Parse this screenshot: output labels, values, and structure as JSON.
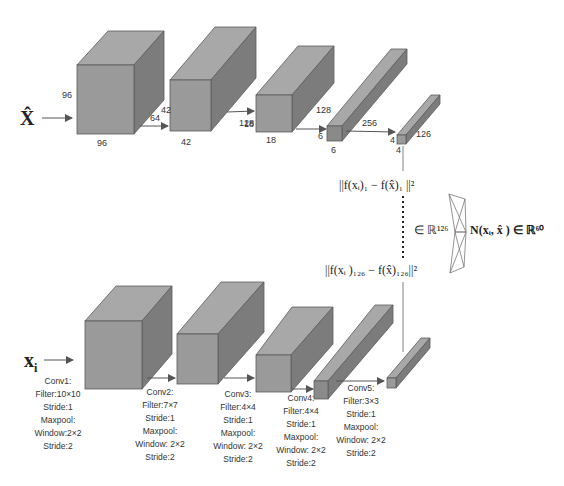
{
  "colors": {
    "front": "#9a9a9a",
    "top": "#a8a8a8",
    "side": "#7c7c7c",
    "edge": "#5a5a5a",
    "line": "#555555",
    "text": "#333333"
  },
  "top_branch": {
    "input_label": "X̂",
    "blocks": [
      {
        "id": "b1",
        "dims": {
          "height": "96",
          "width": "96",
          "depth": "64"
        }
      },
      {
        "id": "b2",
        "dims": {
          "height": "42",
          "width": "42",
          "depth": "128"
        }
      },
      {
        "id": "b3",
        "dims": {
          "height": "18",
          "width": "18",
          "depth": "128"
        }
      },
      {
        "id": "b4",
        "dims": {
          "height": "6",
          "width": "6",
          "depth": "256"
        }
      },
      {
        "id": "b5",
        "dims": {
          "height": "4",
          "width": "4",
          "depth": "126"
        }
      }
    ]
  },
  "bottom_branch": {
    "input_label": "x",
    "input_sub": "i",
    "layers": [
      {
        "name": "Conv1:",
        "filter": "Filter:10×10",
        "stride": "Stride:1",
        "pool": "Maxpool:",
        "window": "Window:2×2",
        "pool_stride": "Stride:2"
      },
      {
        "name": "Conv2:",
        "filter": "Filter:7×7",
        "stride": "Stride:1",
        "pool": "Maxpool:",
        "window": "Window: 2×2",
        "pool_stride": "Stride:2"
      },
      {
        "name": "Conv3:",
        "filter": "Filter:4×4",
        "stride": "Stride:1",
        "pool": "Maxpool:",
        "window": "Window: 2×2",
        "pool_stride": "Stride:2"
      },
      {
        "name": "Conv4:",
        "filter": "Filter:4×4",
        "stride": "Stride:1",
        "pool": "Maxpool:",
        "window": "Window: 2×2",
        "pool_stride": "Stride:2"
      },
      {
        "name": "Conv5:",
        "filter": "Filter:3×3",
        "stride": "Stride:1",
        "pool": "Maxpool:",
        "window": "Window: 2×2",
        "pool_stride": "Stride:2"
      }
    ]
  },
  "equations": {
    "diff_first": "||f(xᵢ)₁ − f(x̂)₁ ||²",
    "diff_last": "||f(xᵢ )₁₂₆ − f(x̂)₁₂₆||²",
    "space": "∈ ℝ¹²⁶",
    "network_output": "N(xᵢ, x̂ ) ∈ ℝ⁶⁰"
  }
}
